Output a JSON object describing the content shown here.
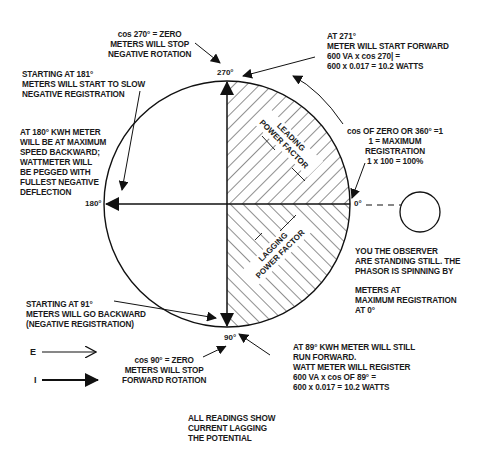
{
  "diagram": {
    "type": "phasor-diagram",
    "circle": {
      "center": [
        227,
        204
      ],
      "radius": 123
    },
    "angles": {
      "top": "270°",
      "right": "0°",
      "bottom": "90°",
      "left": "180°"
    },
    "quadrants": {
      "upper_right": "LEADING\nPOWER FACTOR",
      "lower_right": "LAGGING\nPOWER FACTOR"
    },
    "annotations": {
      "cos270": "cos 270° = ZERO\nMETERS WILL STOP\nNEGATIVE ROTATION",
      "at271": "AT 271°\nMETER WILL START FORWARD\n600 VA x cos 270| =\n600 x 0.017 = 10.2 WATTS",
      "start181": "STARTING AT 181°\nMETERS WILL START TO SLOW\nNEGATIVE REGISTRATION",
      "at180": "AT 180° KWH METER\nWILL BE AT MAXIMUM\nSPEED BACKWARD;\nWATTMETER WILL\nBE PEGGED WITH\nFULLEST NEGATIVE\nDEFLECTION",
      "cos0": "cos OF ZERO OR 360° =1\n1 = MAXIMUM\nREGISTRATION\n1 x 100 = 100%",
      "observer": "YOU THE OBSERVER\nARE STANDING STILL. THE\nPHASOR IS SPINNING BY",
      "meters_max": "METERS AT\nMAXIMUM REGISTRATION\nAT 0°",
      "start91": "STARTING AT 91°\nMETERS WILL GO BACKWARD\n(NEGATIVE REGISTRATION)",
      "cos90": "cos 90° = ZERO\nMETERS WILL STOP\nFORWARD ROTATION",
      "at89": "AT 89° KWH METER WILL STILL\nRUN FORWARD.\nWATT METER WILL REGISTER\n600 VA x cos OF 89° =\n600 x 0.017 = 10.2 WATTS",
      "all_readings": "ALL READINGS SHOW\nCURRENT LAGGING\nTHE POTENTIAL"
    },
    "legend": [
      {
        "symbol": "E",
        "arrow": "open-arrow"
      },
      {
        "symbol": "I",
        "arrow": "filled-arrow"
      }
    ]
  }
}
